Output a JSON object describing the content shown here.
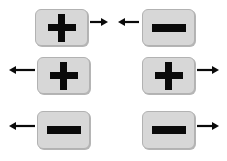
{
  "diagram": {
    "background_color": "#ffffff",
    "card_fill_color": "#d7d7d7",
    "card_border_color": "#b2b2b2",
    "symbol_color": "#0a0a0a",
    "arrow_color": "#0a0a0a",
    "rows": [
      {
        "row_index": 1,
        "items": [
          {
            "id": "row1-left",
            "symbol": "plus",
            "symbol_label": "+",
            "arrow_direction": "right",
            "arrow_side": "right",
            "x": 35,
            "y": 9,
            "width": 53,
            "height": 37
          },
          {
            "id": "row1-right",
            "symbol": "minus",
            "symbol_label": "−",
            "arrow_direction": "left",
            "arrow_side": "left",
            "x": 142,
            "y": 9,
            "width": 53,
            "height": 37
          }
        ]
      },
      {
        "row_index": 2,
        "items": [
          {
            "id": "row2-left",
            "symbol": "plus",
            "symbol_label": "+",
            "arrow_direction": "left",
            "arrow_side": "left",
            "x": 37,
            "y": 57,
            "width": 53,
            "height": 37
          },
          {
            "id": "row2-right",
            "symbol": "plus",
            "symbol_label": "+",
            "arrow_direction": "right",
            "arrow_side": "right",
            "x": 142,
            "y": 57,
            "width": 53,
            "height": 37
          }
        ]
      },
      {
        "row_index": 3,
        "items": [
          {
            "id": "row3-left",
            "symbol": "minus",
            "symbol_label": "−",
            "arrow_direction": "left",
            "arrow_side": "left",
            "x": 37,
            "y": 111,
            "width": 53,
            "height": 38
          },
          {
            "id": "row3-right",
            "symbol": "minus",
            "symbol_label": "−",
            "arrow_direction": "right",
            "arrow_side": "right",
            "x": 142,
            "y": 111,
            "width": 53,
            "height": 38
          }
        ]
      }
    ],
    "arrows": [
      {
        "id": "arrow-row1-left",
        "direction": "right",
        "x": 90,
        "y": 22,
        "length": 18
      },
      {
        "id": "arrow-row1-right",
        "direction": "left",
        "x": 118,
        "y": 22,
        "length": 21
      },
      {
        "id": "arrow-row2-left",
        "direction": "left",
        "x": 9,
        "y": 70,
        "length": 26
      },
      {
        "id": "arrow-row2-right",
        "direction": "right",
        "x": 197,
        "y": 70,
        "length": 22
      },
      {
        "id": "arrow-row3-left",
        "direction": "left",
        "x": 9,
        "y": 126,
        "length": 26
      },
      {
        "id": "arrow-row3-right",
        "direction": "right",
        "x": 197,
        "y": 126,
        "length": 22
      }
    ]
  }
}
